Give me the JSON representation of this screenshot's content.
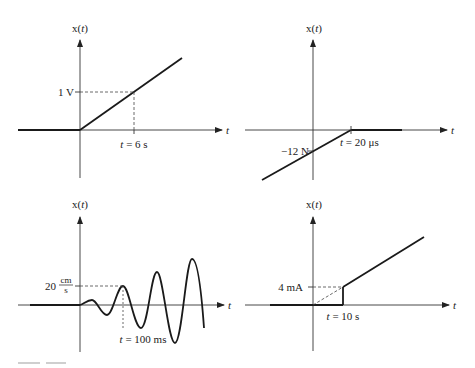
{
  "figure": {
    "caption_visible": "partially cut off (illegible)"
  },
  "panels": [
    {
      "id": "top-left",
      "y_axis_label": "x(",
      "y_axis_var": "t",
      "x_axis_label": "t",
      "y_marker": "1 V",
      "x_marker": "t = 6 s",
      "x_marker_var": "t",
      "x_marker_rest": " = 6 s",
      "description": "Ramp starting at t=0 reaching 1 V at t = 6 s"
    },
    {
      "id": "top-right",
      "y_axis_label": "x(",
      "y_axis_var": "t",
      "x_axis_label": "t",
      "y_marker": "−12 N",
      "x_marker": "t = 20 μs",
      "x_marker_var": "t",
      "x_marker_rest": " = 20 μs",
      "description": "Rising ramp crossing −12 N at t=0, reaching 0 at t = 20 μs, then zero"
    },
    {
      "id": "bottom-left",
      "y_axis_label": "x(",
      "y_axis_var": "t",
      "x_axis_label": "t",
      "y_marker_num": "20",
      "y_marker_unit_num": "cm",
      "y_marker_unit_den": "s",
      "x_marker": "t = 100 ms",
      "x_marker_var": "t",
      "x_marker_rest": " = 100 ms",
      "description": "Growing sinusoid starting at t=0; peak of 20 cm/s at t = 100 ms"
    },
    {
      "id": "bottom-right",
      "y_axis_label": "x(",
      "y_axis_var": "t",
      "x_axis_label": "t",
      "y_marker": "4 mA",
      "x_marker": "t = 10 s",
      "x_marker_var": "t",
      "x_marker_rest": " = 10 s",
      "description": "Zero until t = 10 s, jumps to 4 mA then ramps upward (dashed extension back to origin)"
    }
  ],
  "colors": {
    "line": "#1a1a1a",
    "axis": "#333333",
    "dashed": "#444444",
    "background": "#ffffff"
  }
}
